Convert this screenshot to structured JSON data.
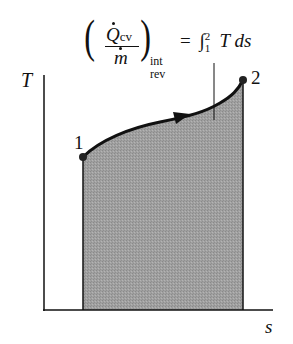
{
  "diagram": {
    "type": "T-s diagram",
    "axes": {
      "y_label": "T",
      "x_label": "s",
      "y_axis_color": "#111111",
      "x_axis_color": "#111111"
    },
    "states": [
      {
        "label": "1",
        "position": "left, lower"
      },
      {
        "label": "2",
        "position": "right, upper"
      }
    ],
    "process_curve": {
      "from": "1",
      "to": "2",
      "direction_arrow": true,
      "color": "#111111"
    },
    "shaded_area": {
      "meaning": "heat transfer per unit mass",
      "fill_color": "#9a9a9a"
    },
    "equation": {
      "lhs_numerator": "Q",
      "lhs_numerator_subscript": "cv",
      "lhs_denominator": "m",
      "lhs_outer_subscript_top": "int",
      "lhs_outer_subscript_bottom": "rev",
      "equals": "=",
      "integral": "∫",
      "upper_limit": "2",
      "lower_limit": "1",
      "integrand": "T ds"
    }
  }
}
